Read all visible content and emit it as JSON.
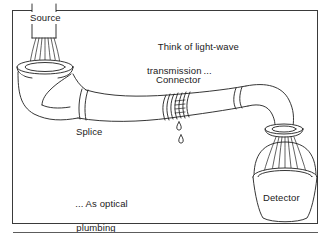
{
  "figure": {
    "name": "optical-plumbing-analogy",
    "background_color": "#ffffff",
    "ink_color": "#1a1a1a",
    "frame_color": "#3a3a3a",
    "rule_color": "#5c5c5c"
  },
  "labels": {
    "source": "Source",
    "connector": "Connector",
    "splice": "Splice",
    "detector": "Detector"
  },
  "captions": {
    "top_line1": "Think of light-wave",
    "top_line2": "transmission ...",
    "bottom_line1": "... As optical",
    "bottom_line2": "plumbing"
  },
  "parts": [
    {
      "id": "source-pipe",
      "label": "Source",
      "icon": "vertical-pipe-icon"
    },
    {
      "id": "source-funnel",
      "label": "",
      "icon": "funnel-icon"
    },
    {
      "id": "left-elbow",
      "label": "",
      "icon": "elbow-pipe-icon"
    },
    {
      "id": "splice-joint",
      "label": "Splice",
      "icon": "pipe-joint-icon"
    },
    {
      "id": "connector-collar",
      "label": "Connector",
      "icon": "threaded-collar-icon"
    },
    {
      "id": "leak-drips",
      "label": "",
      "icon": "water-drop-icon"
    },
    {
      "id": "right-splice",
      "label": "",
      "icon": "pipe-joint-icon"
    },
    {
      "id": "right-elbow",
      "label": "",
      "icon": "elbow-pipe-icon"
    },
    {
      "id": "detector-bucket",
      "label": "Detector",
      "icon": "bucket-icon"
    },
    {
      "id": "light-spray",
      "label": "",
      "icon": "spray-icon"
    }
  ]
}
